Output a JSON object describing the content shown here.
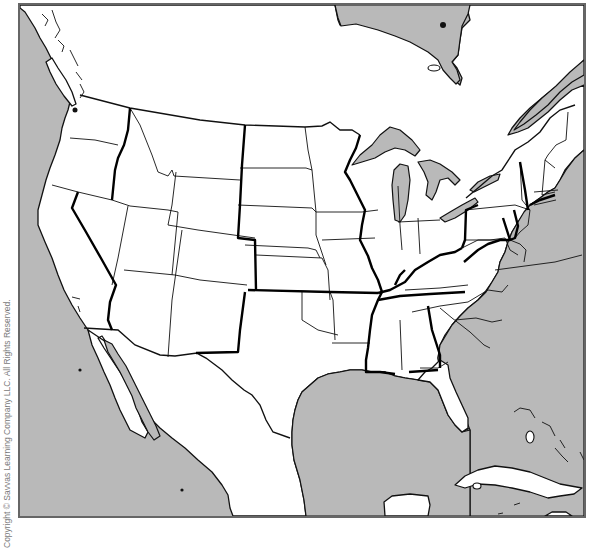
{
  "map": {
    "title": "",
    "type": "outline-political-map",
    "region": "Contiguous United States with surrounding Canada, Mexico, and Caribbean",
    "labels": [],
    "colors": {
      "land": "#ffffff",
      "water": "#b9b9b9",
      "frame_border": "#666666",
      "state_lines": "#111111",
      "region_boundary_lines": "#000000"
    },
    "visible_features": [
      "Pacific Ocean",
      "Gulf of Mexico",
      "Atlantic Ocean",
      "Hudson Bay (partial)",
      "Great Lakes",
      "Gulf of California",
      "Baja California",
      "Florida",
      "Cuba",
      "Bahamas",
      "Yucatan Peninsula",
      "Vancouver Island",
      "Gulf of St. Lawrence"
    ]
  },
  "footer": {
    "copyright": "Copyright © Savvas Learning Company LLC. All Rights Reserved."
  }
}
